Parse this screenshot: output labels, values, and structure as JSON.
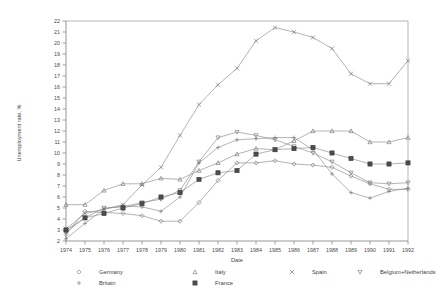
{
  "chart_data": {
    "type": "line",
    "title": "",
    "xlabel": "Date",
    "ylabel": "Unemployment rate, %",
    "xlim": [
      1974,
      1992
    ],
    "ylim": [
      2,
      22
    ],
    "grid": false,
    "legend_position": "bottom",
    "x": [
      1974,
      1975,
      1976,
      1977,
      1978,
      1979,
      1980,
      1981,
      1982,
      1983,
      1984,
      1985,
      1986,
      1987,
      1988,
      1989,
      1990,
      1991,
      1992
    ],
    "xticklabels": [
      "1974",
      "1975",
      "1976",
      "1977",
      "1978",
      "1979",
      "1980",
      "1981",
      "1982",
      "1983",
      "1984",
      "1985",
      "1986",
      "1987",
      "1988",
      "1989",
      "1990",
      "1991",
      "1992"
    ],
    "yticklabels": [
      "2",
      "3",
      "4",
      "5",
      "6",
      "7",
      "8",
      "9",
      "10",
      "11",
      "12",
      "13",
      "14",
      "15",
      "16",
      "17",
      "18",
      "19",
      "20",
      "21",
      "22"
    ],
    "series": [
      {
        "name": "Germany",
        "marker": "diamond",
        "values": [
          2.6,
          4.7,
          4.6,
          4.5,
          4.3,
          3.8,
          3.8,
          5.5,
          7.5,
          9.1,
          9.1,
          9.3,
          9.0,
          8.9,
          8.7,
          7.9,
          7.2,
          6.7,
          6.7
        ]
      },
      {
        "name": "Italy",
        "marker": "triangle-up",
        "values": [
          5.3,
          5.3,
          6.6,
          7.2,
          7.2,
          7.7,
          7.6,
          8.4,
          9.1,
          9.9,
          10.4,
          10.3,
          11.1,
          12.0,
          12.0,
          12.0,
          11.0,
          11.0,
          11.4
        ]
      },
      {
        "name": "Spain",
        "marker": "cross-x",
        "values": [
          3.1,
          4.5,
          4.9,
          5.3,
          7.1,
          8.7,
          11.6,
          14.4,
          16.2,
          17.7,
          20.2,
          21.4,
          21.0,
          20.5,
          19.5,
          17.2,
          16.3,
          16.3,
          18.4
        ]
      },
      {
        "name": "Belgium+Netherlands",
        "marker": "triangle-down",
        "values": [
          2.8,
          4.1,
          5.0,
          5.1,
          5.5,
          5.8,
          6.6,
          9.2,
          11.4,
          11.9,
          11.6,
          11.2,
          10.6,
          10.0,
          9.2,
          8.2,
          7.3,
          7.2,
          7.3
        ]
      },
      {
        "name": "Britain",
        "marker": "plus",
        "values": [
          2.2,
          3.6,
          4.9,
          5.2,
          5.1,
          4.7,
          6.0,
          9.1,
          10.5,
          11.2,
          11.3,
          11.4,
          11.4,
          10.3,
          8.1,
          6.4,
          5.9,
          6.5,
          6.8
        ]
      },
      {
        "name": "France",
        "marker": "square-filled",
        "values": [
          3.0,
          4.1,
          4.5,
          5.0,
          5.4,
          6.0,
          6.4,
          7.6,
          8.2,
          8.4,
          9.9,
          10.3,
          10.4,
          10.5,
          10.0,
          9.5,
          9.0,
          9.0,
          9.1
        ]
      }
    ]
  },
  "legend": {
    "entries": [
      {
        "label": "Germany",
        "marker": "diamond"
      },
      {
        "label": "Italy",
        "marker": "triangle-up"
      },
      {
        "label": "Spain",
        "marker": "cross-x"
      },
      {
        "label": "Belgium+Netherlands",
        "marker": "triangle-down"
      },
      {
        "label": "Britain",
        "marker": "plus"
      },
      {
        "label": "France",
        "marker": "square-filled"
      }
    ]
  },
  "colors": {
    "line": "#8b8b8b",
    "marker": "#6f6f6f",
    "axis": "#7d7d7d",
    "text": "#3f3f3f",
    "background": "#ffffff"
  }
}
